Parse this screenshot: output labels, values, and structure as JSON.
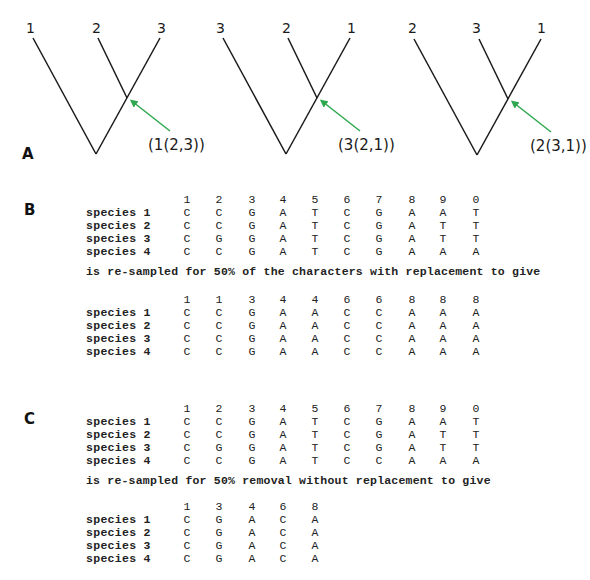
{
  "colors": {
    "line": "#1a1a1a",
    "arrow": "#2ea84f"
  },
  "panel_a": {
    "letter": "A",
    "trees": [
      {
        "tips": [
          "1",
          "2",
          "3"
        ],
        "newick": "(1(2,3))"
      },
      {
        "tips": [
          "3",
          "2",
          "1"
        ],
        "newick": "(3(2,1))"
      },
      {
        "tips": [
          "2",
          "3",
          "1"
        ],
        "newick": "(2(3,1))"
      }
    ]
  },
  "panel_b": {
    "letter": "B",
    "original": {
      "columns": [
        "1",
        "2",
        "3",
        "4",
        "5",
        "6",
        "7",
        "8",
        "9",
        "0"
      ],
      "rows": [
        {
          "label": "species 1",
          "cells": [
            "C",
            "C",
            "G",
            "A",
            "T",
            "C",
            "G",
            "A",
            "A",
            "T"
          ]
        },
        {
          "label": "species 2",
          "cells": [
            "C",
            "C",
            "G",
            "A",
            "T",
            "C",
            "G",
            "A",
            "T",
            "T"
          ]
        },
        {
          "label": "species 3",
          "cells": [
            "C",
            "G",
            "G",
            "A",
            "T",
            "C",
            "G",
            "A",
            "T",
            "T"
          ]
        },
        {
          "label": "species 4",
          "cells": [
            "C",
            "C",
            "G",
            "A",
            "T",
            "C",
            "G",
            "A",
            "A",
            "A"
          ]
        }
      ]
    },
    "caption": "is re-sampled for 50% of the characters with replacement to give",
    "resampled": {
      "columns": [
        "1",
        "1",
        "3",
        "4",
        "4",
        "6",
        "6",
        "8",
        "8",
        "8"
      ],
      "rows": [
        {
          "label": "species 1",
          "cells": [
            "C",
            "C",
            "G",
            "A",
            "A",
            "C",
            "C",
            "A",
            "A",
            "A"
          ]
        },
        {
          "label": "species 2",
          "cells": [
            "C",
            "C",
            "G",
            "A",
            "A",
            "C",
            "C",
            "A",
            "A",
            "A"
          ]
        },
        {
          "label": "species 3",
          "cells": [
            "C",
            "C",
            "G",
            "A",
            "A",
            "C",
            "C",
            "A",
            "A",
            "A"
          ]
        },
        {
          "label": "species 4",
          "cells": [
            "C",
            "C",
            "G",
            "A",
            "A",
            "C",
            "C",
            "A",
            "A",
            "A"
          ]
        }
      ]
    }
  },
  "panel_c": {
    "letter": "C",
    "original": {
      "columns": [
        "1",
        "2",
        "3",
        "4",
        "5",
        "6",
        "7",
        "8",
        "9",
        "0"
      ],
      "rows": [
        {
          "label": "species 1",
          "cells": [
            "C",
            "C",
            "G",
            "A",
            "T",
            "C",
            "G",
            "A",
            "A",
            "T"
          ]
        },
        {
          "label": "species 2",
          "cells": [
            "C",
            "C",
            "G",
            "A",
            "T",
            "C",
            "G",
            "A",
            "T",
            "T"
          ]
        },
        {
          "label": "species 3",
          "cells": [
            "C",
            "G",
            "G",
            "A",
            "T",
            "C",
            "G",
            "A",
            "T",
            "T"
          ]
        },
        {
          "label": "species 4",
          "cells": [
            "C",
            "C",
            "G",
            "A",
            "T",
            "C",
            "C",
            "A",
            "A",
            "A"
          ]
        }
      ]
    },
    "caption": "is re-sampled for 50% removal without replacement to give",
    "resampled": {
      "columns": [
        "1",
        "3",
        "4",
        "6",
        "8"
      ],
      "rows": [
        {
          "label": "species 1",
          "cells": [
            "C",
            "G",
            "A",
            "C",
            "A"
          ]
        },
        {
          "label": "species 2",
          "cells": [
            "C",
            "G",
            "A",
            "C",
            "A"
          ]
        },
        {
          "label": "species 3",
          "cells": [
            "C",
            "G",
            "A",
            "C",
            "A"
          ]
        },
        {
          "label": "species 4",
          "cells": [
            "C",
            "G",
            "A",
            "C",
            "A"
          ]
        }
      ]
    }
  }
}
